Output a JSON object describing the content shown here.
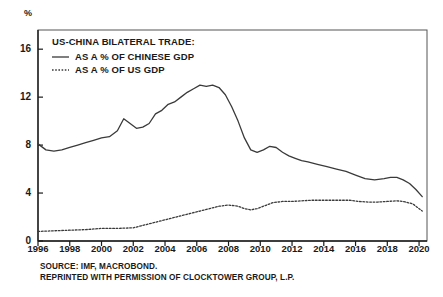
{
  "axis": {
    "unit_label": "%",
    "y_ticks": [
      "0",
      "4",
      "8",
      "12",
      "16"
    ],
    "x_ticks": [
      "1996",
      "1998",
      "2000",
      "2002",
      "2004",
      "2006",
      "2008",
      "2010",
      "2012",
      "2014",
      "2016",
      "2018",
      "2020"
    ]
  },
  "legend": {
    "title": "US-CHINA BILATERAL TRADE:",
    "items": [
      {
        "label": "AS A % OF CHINESE GDP",
        "style": "solid"
      },
      {
        "label": "AS A % OF US GDP",
        "style": "dotted"
      }
    ]
  },
  "footer": {
    "line1": "SOURCE: IMF, MACROBOND.",
    "line2": "REPRINTED WITH PERMISSION OF CLOCKTOWER GROUP, L.P."
  },
  "colors": {
    "line": "#3a3a3a",
    "frame": "#555555",
    "text": "#1a1a1a",
    "background": "#ffffff"
  },
  "chart_data": {
    "type": "line",
    "title": "US-CHINA BILATERAL TRADE:",
    "xlabel": "",
    "ylabel": "%",
    "xlim": [
      1996,
      2020.5
    ],
    "ylim": [
      0,
      17.6
    ],
    "yticks": [
      0,
      4,
      8,
      12,
      16
    ],
    "xticks": [
      1996,
      1998,
      2000,
      2002,
      2004,
      2006,
      2008,
      2010,
      2012,
      2014,
      2016,
      2018,
      2020
    ],
    "grid": false,
    "legend_position": "top-left",
    "series": [
      {
        "name": "AS A % OF CHINESE GDP",
        "style": "solid",
        "x": [
          1996.0,
          1996.5,
          1997.0,
          1997.5,
          1998.0,
          1998.5,
          1999.0,
          1999.5,
          2000.0,
          2000.5,
          2001.0,
          2001.4,
          2001.8,
          2002.2,
          2002.6,
          2003.0,
          2003.4,
          2003.8,
          2004.2,
          2004.6,
          2005.0,
          2005.4,
          2005.8,
          2006.2,
          2006.6,
          2007.0,
          2007.4,
          2007.8,
          2008.2,
          2008.6,
          2009.0,
          2009.4,
          2009.8,
          2010.2,
          2010.6,
          2011.0,
          2011.4,
          2011.8,
          2012.2,
          2012.6,
          2013.0,
          2013.6,
          2014.2,
          2014.8,
          2015.4,
          2016.0,
          2016.6,
          2017.2,
          2017.8,
          2018.2,
          2018.6,
          2019.0,
          2019.4,
          2019.8,
          2020.2
        ],
        "y": [
          8.1,
          7.6,
          7.5,
          7.6,
          7.8,
          8.0,
          8.2,
          8.4,
          8.6,
          8.7,
          9.2,
          10.2,
          9.8,
          9.4,
          9.5,
          9.8,
          10.6,
          10.9,
          11.4,
          11.6,
          12.0,
          12.4,
          12.7,
          13.0,
          12.9,
          13.0,
          12.8,
          12.2,
          11.2,
          10.0,
          8.6,
          7.6,
          7.4,
          7.6,
          7.9,
          7.8,
          7.4,
          7.1,
          6.9,
          6.7,
          6.6,
          6.4,
          6.2,
          6.0,
          5.8,
          5.5,
          5.2,
          5.1,
          5.2,
          5.3,
          5.3,
          5.1,
          4.8,
          4.3,
          3.7
        ]
      },
      {
        "name": "AS A % OF US GDP",
        "style": "dotted",
        "x": [
          1996.0,
          1997.0,
          1998.0,
          1999.0,
          2000.0,
          2001.0,
          2002.0,
          2002.6,
          2003.2,
          2003.8,
          2004.4,
          2005.0,
          2005.6,
          2006.2,
          2006.8,
          2007.4,
          2008.0,
          2008.6,
          2009.0,
          2009.4,
          2009.8,
          2010.2,
          2010.8,
          2011.4,
          2012.0,
          2012.6,
          2013.2,
          2013.8,
          2014.4,
          2015.0,
          2015.6,
          2016.2,
          2016.8,
          2017.4,
          2018.0,
          2018.6,
          2019.0,
          2019.6,
          2020.2
        ],
        "y": [
          0.8,
          0.85,
          0.9,
          0.95,
          1.05,
          1.05,
          1.1,
          1.3,
          1.5,
          1.7,
          1.9,
          2.1,
          2.3,
          2.5,
          2.7,
          2.9,
          3.0,
          2.9,
          2.7,
          2.6,
          2.7,
          2.9,
          3.2,
          3.3,
          3.3,
          3.35,
          3.4,
          3.4,
          3.4,
          3.4,
          3.4,
          3.3,
          3.25,
          3.25,
          3.3,
          3.35,
          3.3,
          3.1,
          2.5
        ]
      }
    ]
  }
}
